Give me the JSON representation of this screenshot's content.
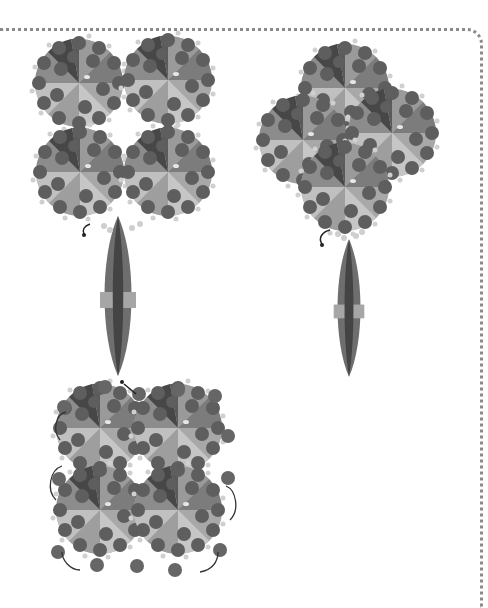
{
  "figure": {
    "panels": [
      {
        "id": "assembly-top-left",
        "layout": "square-2x2",
        "units": 4,
        "has_rod": true
      },
      {
        "id": "assembly-top-right",
        "layout": "diamond",
        "units": 4,
        "has_rod": true
      },
      {
        "id": "assembly-bottom-left",
        "layout": "square-2x2-with-linkers",
        "units": 4,
        "has_rod": false
      }
    ],
    "colors": {
      "background": "#ffffff",
      "border_dots": "#8a8a8a",
      "sphere": "#5e5e5e",
      "wedge_dark": "#3f3f3f",
      "wedge_mid": "#7a7a7a",
      "wedge_light": "#b4b4b4",
      "linker": "#c8c8c8",
      "rod_outer": "#6e6e6e",
      "rod_inner": "#444444",
      "rod_band": "#a6a6a6"
    }
  }
}
